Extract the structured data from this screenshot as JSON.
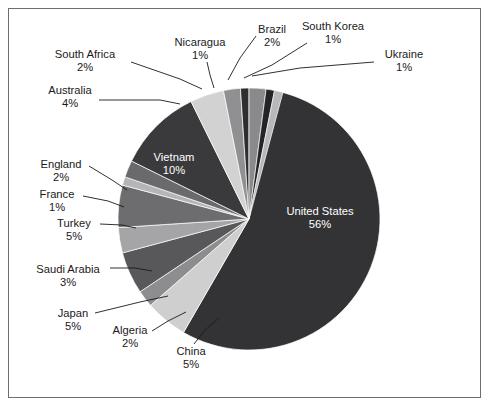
{
  "figure": {
    "background_color": "#ffffff",
    "border_color": "#6e6e70",
    "width": 491,
    "height": 408
  },
  "chart_data": {
    "type": "pie",
    "title": "",
    "subtitle": "",
    "xlabel": "",
    "ylabel": "",
    "legend_position": "none",
    "grid": false,
    "value_unit": "%",
    "total": 100,
    "center": {
      "x": 249,
      "y": 219
    },
    "radius": 131,
    "start_angle_deg": -90,
    "direction": "clockwise",
    "categories": [
      "United States",
      "China",
      "Algeria",
      "Japan",
      "Saudi Arabia",
      "Turkey",
      "France",
      "England",
      "Vietnam",
      "Australia",
      "South Africa",
      "Nicaragua",
      "Brazil",
      "South Korea",
      "Ukraine"
    ],
    "values": [
      56,
      5,
      2,
      5,
      3,
      1,
      1,
      2,
      10,
      4,
      2,
      1,
      2,
      1,
      1
    ],
    "labels": [
      "United States\n56%",
      "China\n5%",
      "Algeria\n2%",
      "Japan\n5%",
      "Saudi Arabia\n3%",
      "Turkey\n5%",
      "France\n1%",
      "England\n2%",
      "Vietnam\n10%",
      "Australia\n4%",
      "South Africa\n2%",
      "Nicaragua\n1%",
      "Brazil\n2%",
      "South Korea\n1%",
      "Ukraine\n1%"
    ],
    "colors": [
      "#333335",
      "#cfcfcf",
      "#8d8d8f",
      "#58585a",
      "#a5a5a7",
      "#6d6d6f",
      "#b5b5b7",
      "#6a6a6c",
      "#3a3a3c",
      "#d2d2d2",
      "#909092",
      "#2e2e30",
      "#8a8a8c",
      "#242426",
      "#b8b8ba"
    ],
    "slices": [
      {
        "name": "United States",
        "value": 56,
        "percent_label": "56%",
        "color": "#333335",
        "label_placement": "inside",
        "label_x": 320,
        "label_y": 215,
        "label_color": "#ffffff"
      },
      {
        "name": "China",
        "value": 5,
        "percent_label": "5%",
        "color": "#cfcfcf",
        "label_placement": "outside",
        "label_x": 191,
        "label_y": 355,
        "label_anchor": "middle",
        "leader": [
          [
            194,
            344
          ],
          [
            205,
            330
          ],
          [
            219,
            318
          ]
        ]
      },
      {
        "name": "Algeria",
        "value": 2,
        "percent_label": "2%",
        "color": "#8d8d8f",
        "label_placement": "outside",
        "label_x": 130,
        "label_y": 334,
        "label_anchor": "middle",
        "leader": [
          [
            152,
            331
          ],
          [
            168,
            321
          ],
          [
            186,
            312
          ]
        ]
      },
      {
        "name": "Japan",
        "value": 5,
        "percent_label": "5%",
        "color": "#58585a",
        "label_placement": "outside",
        "label_x": 73,
        "label_y": 317,
        "label_anchor": "middle",
        "leader": [
          [
            95,
            313
          ],
          [
            140,
            302
          ],
          [
            168,
            296
          ]
        ]
      },
      {
        "name": "Saudi Arabia",
        "value": 3,
        "percent_label": "3%",
        "color": "#a5a5a7",
        "label_placement": "outside",
        "label_x": 68,
        "label_y": 273,
        "label_anchor": "middle",
        "leader": [
          [
            110,
            268
          ],
          [
            135,
            268
          ],
          [
            152,
            271
          ]
        ]
      },
      {
        "name": "Turkey",
        "value": 5,
        "percent_label": "5%",
        "color": "#6d6d6f",
        "label_placement": "outside",
        "label_x": 74,
        "label_y": 227,
        "label_anchor": "middle",
        "leader": [
          [
            100,
            224
          ],
          [
            122,
            225
          ],
          [
            136,
            228
          ]
        ]
      },
      {
        "name": "France",
        "value": 1,
        "percent_label": "1%",
        "color": "#b5b5b7",
        "label_placement": "outside",
        "label_x": 57,
        "label_y": 198,
        "label_anchor": "middle",
        "leader": [
          [
            83,
            196
          ],
          [
            108,
            201
          ],
          [
            124,
            207
          ]
        ]
      },
      {
        "name": "England",
        "value": 2,
        "percent_label": "2%",
        "color": "#6a6a6c",
        "label_placement": "outside",
        "label_x": 61,
        "label_y": 168,
        "label_anchor": "middle",
        "leader": [
          [
            89,
            166
          ],
          [
            112,
            180
          ],
          [
            127,
            190
          ]
        ]
      },
      {
        "name": "Vietnam",
        "value": 10,
        "percent_label": "10%",
        "color": "#3a3a3c",
        "label_placement": "inside",
        "label_x": 174,
        "label_y": 161,
        "label_color": "#ffffff"
      },
      {
        "name": "Australia",
        "value": 4,
        "percent_label": "4%",
        "color": "#d2d2d2",
        "label_placement": "outside",
        "label_x": 70,
        "label_y": 94,
        "label_anchor": "middle",
        "leader": [
          [
            99,
            100
          ],
          [
            160,
            100
          ],
          [
            180,
            104
          ]
        ]
      },
      {
        "name": "South Africa",
        "value": 2,
        "percent_label": "2%",
        "color": "#909092",
        "label_placement": "outside",
        "label_x": 85,
        "label_y": 58,
        "label_anchor": "middle",
        "leader": [
          [
            131,
            62
          ],
          [
            180,
            79
          ],
          [
            202,
            89
          ]
        ]
      },
      {
        "name": "Nicaragua",
        "value": 1,
        "percent_label": "1%",
        "color": "#2e2e30",
        "label_placement": "outside",
        "label_x": 200,
        "label_y": 46,
        "label_anchor": "middle",
        "leader": [
          [
            207,
            62
          ],
          [
            210,
            75
          ],
          [
            214,
            88
          ]
        ]
      },
      {
        "name": "Brazil",
        "value": 2,
        "percent_label": "2%",
        "color": "#8a8a8c",
        "label_placement": "outside",
        "label_x": 272,
        "label_y": 33,
        "label_anchor": "middle",
        "leader": [
          [
            256,
            36
          ],
          [
            240,
            58
          ],
          [
            228,
            80
          ]
        ]
      },
      {
        "name": "South Korea",
        "value": 1,
        "percent_label": "1%",
        "color": "#242426",
        "label_placement": "outside",
        "label_x": 333,
        "label_y": 30,
        "label_anchor": "middle",
        "leader": [
          [
            307,
            43
          ],
          [
            272,
            65
          ],
          [
            244,
            78
          ]
        ]
      },
      {
        "name": "Ukraine",
        "value": 1,
        "percent_label": "1%",
        "color": "#b8b8ba",
        "label_placement": "outside",
        "label_x": 404,
        "label_y": 58,
        "label_anchor": "middle",
        "leader": [
          [
            374,
            62
          ],
          [
            300,
            68
          ],
          [
            252,
            76
          ]
        ]
      }
    ]
  }
}
